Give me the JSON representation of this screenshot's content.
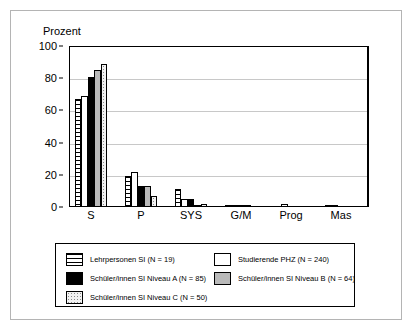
{
  "chart_data": {
    "type": "bar",
    "title": "",
    "xlabel": "",
    "ylabel": "Prozent",
    "ylim": [
      0,
      100
    ],
    "yticks": [
      0,
      20,
      40,
      60,
      80,
      100
    ],
    "grid": true,
    "legend_position": "bottom",
    "categories": [
      "S",
      "P",
      "SYS",
      "G/M",
      "Prog",
      "Mas"
    ],
    "series": [
      {
        "name": "Lehrpersonen SI (N = 19)",
        "pattern": "horizontal-stripes",
        "values": [
          67,
          19,
          11,
          1,
          0,
          1
        ]
      },
      {
        "name": "Studierende PHZ (N = 240)",
        "pattern": "white",
        "values": [
          69,
          22,
          5,
          0.5,
          2,
          0.5
        ]
      },
      {
        "name": "Schüler/innen SI Niveau A (N = 85)",
        "pattern": "black",
        "values": [
          81,
          13,
          5,
          0.5,
          0,
          0
        ]
      },
      {
        "name": "Schüler/innen SI Niveau B (N = 64)",
        "pattern": "gray",
        "values": [
          85,
          13,
          1,
          1,
          0,
          0
        ]
      },
      {
        "name": "Schüler/innen SI Niveau C (N = 50)",
        "pattern": "dotted",
        "values": [
          89,
          7,
          2,
          0,
          0,
          0
        ]
      }
    ]
  },
  "axis": {
    "y_title": "Prozent",
    "y_tick_labels": [
      "100",
      "80",
      "60",
      "40",
      "20",
      "0"
    ],
    "x_tick_labels": [
      "S",
      "P",
      "SYS",
      "G/M",
      "Prog",
      "Mas"
    ]
  },
  "legend": {
    "entries": [
      {
        "label": "Lehrpersonen SI (N = 19)",
        "pattern": "horizontal-stripes"
      },
      {
        "label": "Studierende PHZ (N = 240)",
        "pattern": "white"
      },
      {
        "label": "Schüler/innen SI Niveau A (N = 85)",
        "pattern": "black"
      },
      {
        "label": "Schüler/innen SI Niveau B (N = 64)",
        "pattern": "gray"
      },
      {
        "label": "Schüler/innen SI Niveau C (N = 50)",
        "pattern": "dotted"
      }
    ]
  },
  "colors": {
    "black": "#000000",
    "gray_fill": "#b9b9b9",
    "dotted_fill": "#f2f2f2",
    "gridline": "#c8c8c8",
    "frame": "#b4b4b4"
  }
}
